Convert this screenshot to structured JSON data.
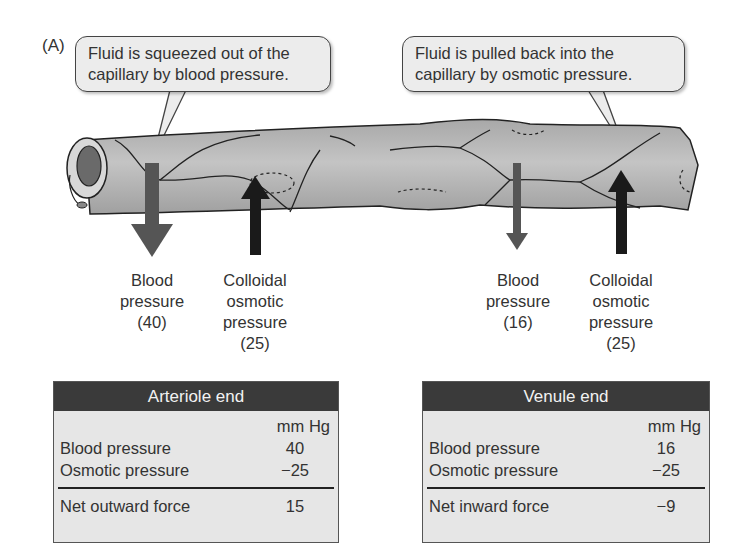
{
  "figure": {
    "panel_label": "(A)",
    "callouts": {
      "left": {
        "line1": "Fluid is squeezed out of the",
        "line2": "capillary by blood pressure."
      },
      "right": {
        "line1": "Fluid is pulled back into the",
        "line2": "capillary by osmotic pressure."
      }
    },
    "arrow_labels": {
      "arterial_blood": {
        "line1": "Blood",
        "line2": "pressure",
        "line3": "(40)"
      },
      "arterial_osmotic": {
        "line1": "Colloidal",
        "line2": "osmotic",
        "line3": "pressure",
        "line4": "(25)"
      },
      "venous_blood": {
        "line1": "Blood",
        "line2": "pressure",
        "line3": "(16)"
      },
      "venous_osmotic": {
        "line1": "Colloidal",
        "line2": "osmotic",
        "line3": "pressure",
        "line4": "(25)"
      }
    },
    "colors": {
      "capillary_fill": "#b5b5b5",
      "blood_pressure_arrow": "#555555",
      "osmotic_arrow": "#1a1a1a",
      "table_header": "#3a3a3a",
      "table_body": "#e6e6e6"
    }
  },
  "tables": {
    "arteriole": {
      "title": "Arteriole end",
      "units": "mm Hg",
      "rows": [
        {
          "label": "Blood pressure",
          "value": "40"
        },
        {
          "label": "Osmotic pressure",
          "value": "−25"
        }
      ],
      "net": {
        "label": "Net outward force",
        "value": "15"
      }
    },
    "venule": {
      "title": "Venule end",
      "units": "mm Hg",
      "rows": [
        {
          "label": "Blood pressure",
          "value": "16"
        },
        {
          "label": "Osmotic pressure",
          "value": "−25"
        }
      ],
      "net": {
        "label": "Net inward force",
        "value": "−9"
      }
    }
  }
}
